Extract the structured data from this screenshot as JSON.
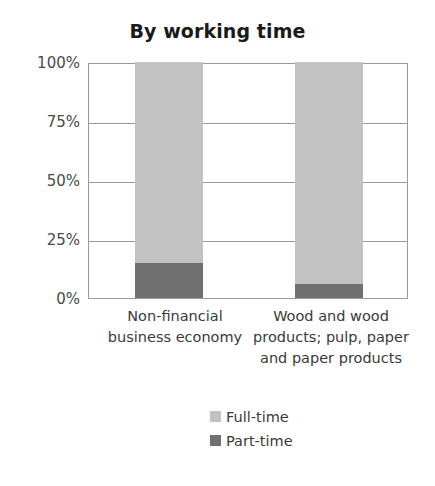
{
  "chart_data": {
    "type": "bar",
    "subtype": "stacked-percentage-column",
    "title": "By working time",
    "xlabel": "",
    "ylabel": "",
    "ylim": [
      0,
      100
    ],
    "ytick_labels": [
      "100%",
      "75%",
      "50%",
      "25%",
      "0%"
    ],
    "ytick_values": [
      100,
      75,
      50,
      25,
      0
    ],
    "grid": true,
    "legend_position": "bottom-center",
    "categories": [
      "Non-financial business economy",
      "Wood and wood products; pulp, paper and paper products"
    ],
    "category_label_lines": [
      [
        "Non-financial",
        "business economy"
      ],
      [
        "Wood and wood",
        "products; pulp, paper",
        "and paper products"
      ]
    ],
    "series": [
      {
        "name": "Full-time",
        "color": "#c2c2c2",
        "values": [
          85,
          94
        ]
      },
      {
        "name": "Part-time",
        "color": "#707070",
        "values": [
          15,
          6
        ]
      }
    ],
    "stack_order_bottom_to_top": [
      "Part-time",
      "Full-time"
    ]
  },
  "axis": {
    "ticks": [
      {
        "label": "100%",
        "value": 100
      },
      {
        "label": "75%",
        "value": 75
      },
      {
        "label": "50%",
        "value": 50
      },
      {
        "label": "25%",
        "value": 25
      },
      {
        "label": "0%",
        "value": 0
      }
    ]
  },
  "legend": {
    "items": [
      {
        "label": "Full-time",
        "color": "#c2c2c2"
      },
      {
        "label": "Part-time",
        "color": "#707070"
      }
    ]
  },
  "colors": {
    "background": "#ffffff",
    "axis_line": "#9a9a9a",
    "text": "#3a3a3a",
    "title_text": "#1a1a1a",
    "full_time": "#c2c2c2",
    "part_time": "#707070"
  }
}
